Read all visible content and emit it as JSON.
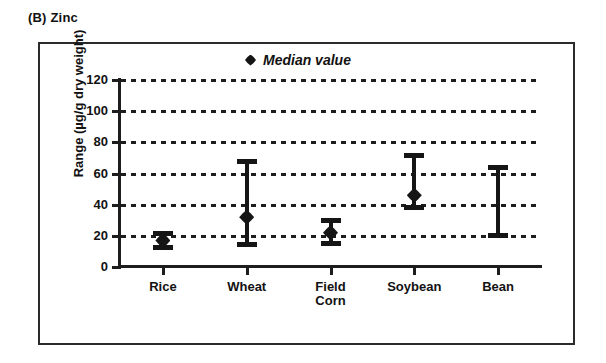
{
  "figure": {
    "panel_caption": "(B) Zinc"
  },
  "legend": {
    "marker_shape": "diamond-marker-icon",
    "label": "Median value"
  },
  "chart_data": {
    "type": "scatter",
    "title": "(B) Zinc",
    "xlabel": "",
    "ylabel": "Range (µg/g dry weight)",
    "ylim": [
      0,
      120
    ],
    "yticks": [
      0,
      20,
      40,
      60,
      80,
      100,
      120
    ],
    "ytick_labels": [
      "0",
      "20",
      "40",
      "60",
      "80",
      "100",
      "120"
    ],
    "grid": true,
    "grid_style": "dashed-horizontal",
    "legend_position": "top-center",
    "legend_entries": [
      "Median value"
    ],
    "categories": [
      "Rice",
      "Wheat",
      "Field Corn",
      "Soybean",
      "Bean"
    ],
    "category_labels": [
      "Rice",
      "Wheat",
      "Field\nCorn",
      "Soybean",
      "Bean"
    ],
    "series": [
      {
        "name": "Range (min–max)",
        "points": [
          {
            "category": "Rice",
            "min": 12,
            "max": 22,
            "median": 17
          },
          {
            "category": "Wheat",
            "min": 14,
            "max": 68,
            "median": 32
          },
          {
            "category": "Field Corn",
            "min": 15,
            "max": 30,
            "median": 22
          },
          {
            "category": "Soybean",
            "min": 38,
            "max": 72,
            "median": 46
          },
          {
            "category": "Bean",
            "min": 20,
            "max": 64,
            "median": null
          }
        ]
      }
    ]
  }
}
